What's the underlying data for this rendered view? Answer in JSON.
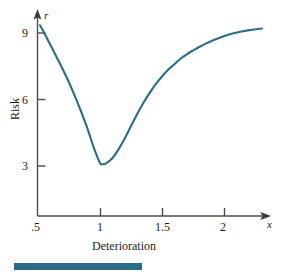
{
  "figure": {
    "background_color": "#ffffff",
    "curve_color": "#2b6e87",
    "axis_color": "#4d4d4d",
    "text_color": "#1a1a1a",
    "rule_color": "#2a6c8a"
  },
  "axes": {
    "y": {
      "variable_label": "r",
      "title": "Risk",
      "tick_labels": [
        "9",
        "6",
        "3"
      ],
      "tick_values": [
        9,
        6,
        3
      ]
    },
    "x": {
      "variable_label": "x",
      "title": "Deterioration",
      "tick_labels": [
        ".5",
        "1",
        "1.5",
        "2"
      ],
      "tick_values": [
        0.5,
        1,
        1.5,
        2
      ]
    }
  },
  "chart_data": {
    "type": "line",
    "title": "",
    "subtitle": "",
    "xlabel": "Deterioration",
    "ylabel": "Risk",
    "x_axis_variable": "x",
    "y_axis_variable": "r",
    "xlim": [
      0.5,
      2.32
    ],
    "ylim": [
      0.0,
      9.8
    ],
    "xticks": [
      0.5,
      1.0,
      1.5,
      2.0
    ],
    "xticklabels": [
      ".5",
      "1",
      "1.5",
      "2"
    ],
    "yticks": [
      3,
      6,
      9
    ],
    "yticklabels": [
      "3",
      "6",
      "9"
    ],
    "grid": false,
    "legend": null,
    "legend_position": "none",
    "annotations": [],
    "series": [
      {
        "name": "Risk curve",
        "color": "#2b6e87",
        "x": [
          0.52,
          0.55,
          0.6,
          0.65,
          0.7,
          0.75,
          0.8,
          0.85,
          0.9,
          0.95,
          1.0,
          1.02,
          1.05,
          1.1,
          1.15,
          1.2,
          1.25,
          1.3,
          1.35,
          1.4,
          1.45,
          1.5,
          1.55,
          1.6,
          1.65,
          1.7,
          1.75,
          1.8,
          1.85,
          1.9,
          1.95,
          2.0,
          2.05,
          2.1,
          2.15,
          2.2,
          2.25,
          2.3
        ],
        "y": [
          9.35,
          9.05,
          8.5,
          7.95,
          7.4,
          6.8,
          6.15,
          5.45,
          4.7,
          3.85,
          3.15,
          3.08,
          3.12,
          3.35,
          3.75,
          4.25,
          4.8,
          5.35,
          5.85,
          6.3,
          6.7,
          7.05,
          7.35,
          7.6,
          7.85,
          8.05,
          8.22,
          8.38,
          8.52,
          8.65,
          8.76,
          8.86,
          8.95,
          9.02,
          9.08,
          9.13,
          9.17,
          9.2
        ]
      }
    ],
    "minimum_point": {
      "x": 1.02,
      "y": 3.08
    },
    "endpoint_left": {
      "x": 0.52,
      "y": 9.35
    },
    "endpoint_right": {
      "x": 2.3,
      "y": 9.2
    }
  },
  "bottom_rule": {
    "present": true,
    "color": "#2a6c8a"
  }
}
